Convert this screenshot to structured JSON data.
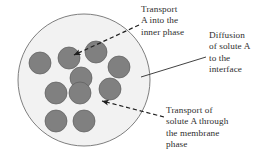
{
  "figure": {
    "kind": "emulsion-droplet-transport-diagram",
    "background_color": "#ffffff"
  },
  "droplet": {
    "name": "membrane phase droplet",
    "fill_color": "#f2f2f2",
    "stroke_color": "#6e6e6e",
    "center_x": 84,
    "center_y": 80,
    "radius": 66
  },
  "inner_phase": {
    "name": "inner phase globules",
    "fill_color": "#808080",
    "stroke_color": "#5a5a5a",
    "count": 10,
    "radius": 11,
    "globules": [
      {
        "cx": 40,
        "cy": 63
      },
      {
        "cx": 69,
        "cy": 58
      },
      {
        "cx": 96,
        "cy": 52
      },
      {
        "cx": 119,
        "cy": 67
      },
      {
        "cx": 81,
        "cy": 78
      },
      {
        "cx": 110,
        "cy": 89
      },
      {
        "cx": 56,
        "cy": 93
      },
      {
        "cx": 80,
        "cy": 93
      },
      {
        "cx": 56,
        "cy": 121
      },
      {
        "cx": 84,
        "cy": 121
      }
    ]
  },
  "labels": {
    "transport_inner": {
      "text": "Transport\nA into the\ninner phase",
      "line_style": "dashed",
      "arrow_head": "at-globule"
    },
    "diffusion_interface": {
      "text": "Diffusion\nof solute A\nto the\ninterface",
      "line_style": "solid",
      "arrow_head": "none"
    },
    "transport_membrane": {
      "text": "Transport of\nsolute A through\nthe membrane\nphase",
      "line_style": "dashed",
      "arrow_head": "at-membrane"
    }
  },
  "leaders": {
    "stroke_color": "#2b2b2b",
    "transport_inner": {
      "x1": 139,
      "y1": 25,
      "x2": 72,
      "y2": 56
    },
    "diffusion_interface": {
      "x1": 206,
      "y1": 57,
      "x2": 140,
      "y2": 77
    },
    "transport_membrane": {
      "x1": 164,
      "y1": 117,
      "x2": 100,
      "y2": 101
    }
  }
}
